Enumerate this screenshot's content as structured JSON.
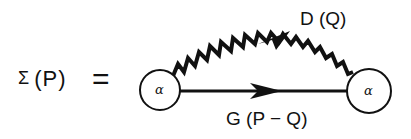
{
  "equation": {
    "lhs_symbol": "Σ",
    "lhs_argument": "(P)",
    "equals": "="
  },
  "diagram": {
    "vertices": [
      {
        "id": "left-vertex",
        "label": "α",
        "cx": 160,
        "cy": 90,
        "r": 20
      },
      {
        "id": "right-vertex",
        "label": "α",
        "cx": 369,
        "cy": 91,
        "r": 22
      }
    ],
    "propagators": [
      {
        "id": "photon-line",
        "type": "wavy",
        "label": "D (Q)",
        "arrow": "right"
      },
      {
        "id": "fermion-line",
        "type": "solid",
        "label": "G (P − Q)",
        "arrow": "right"
      }
    ]
  },
  "colors": {
    "ink": "#111111",
    "background": "#ffffff"
  }
}
